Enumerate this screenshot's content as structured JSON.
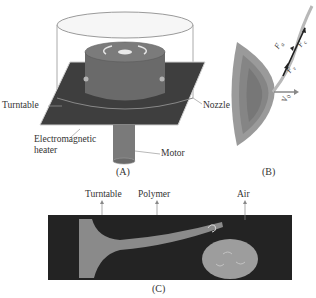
{
  "panel_a": {
    "caption": "(A)",
    "labels": {
      "turntable": "Turntable",
      "nozzle": "Nozzle",
      "heater_line1": "Electromagnetic",
      "heater_line2": "heater",
      "motor": "Motor"
    }
  },
  "panel_b": {
    "caption": "(B)",
    "force_labels": [
      "F_a",
      "F_c",
      "F_v",
      "V_0"
    ]
  },
  "panel_c": {
    "caption": "(C)",
    "labels": {
      "turntable": "Turntable",
      "polymer": "Polymer",
      "air": "Air"
    }
  },
  "colors": {
    "plate": "#3e3e3e",
    "cylinder": "#6a6a6a",
    "enclosure_stroke": "#888888",
    "photo_bg": "#232323",
    "polymer": "#8a8a8a",
    "nozzle_fill": "#9a9a9a"
  }
}
